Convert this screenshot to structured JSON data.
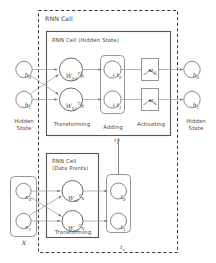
{
  "diagram": {
    "outer_box_label": "RNN Cell",
    "hidden_box_label": "RNN Cell (Hidden State)",
    "data_box_label_line1": "RNN Cell",
    "data_box_label_line2": "(Data Points)",
    "stage_labels": {
      "hidden_state_left_line1": "Hidden",
      "hidden_state_left_line2": "State",
      "hidden_state_right_line1": "Hidden",
      "hidden_state_right_line2": "State",
      "transforming_top": "Transforming",
      "adding_line1": "Adding",
      "adding_line2": "t",
      "adding_line2_sub": "x",
      "activating": "Activating",
      "transforming_bottom": "Transforming",
      "tx_group": "t",
      "tx_group_sub": "x",
      "x_group": "X"
    },
    "nodes": {
      "hidden_inputs": [
        {
          "base": "h",
          "sub": "0"
        },
        {
          "base": "h",
          "sub": "1"
        }
      ],
      "hidden_transform": [
        {
          "base": "W",
          "sub": "h0",
          "sup": "T",
          "arg": "h"
        },
        {
          "base": "W",
          "sub": "h1",
          "sup": "T",
          "arg": "h"
        }
      ],
      "adding": [
        {
          "base": "+t",
          "sub": "0"
        },
        {
          "base": "+t",
          "sub": "1"
        }
      ],
      "activating": [
        {
          "base": "z",
          "sub": "0"
        },
        {
          "base": "z",
          "sub": "1"
        }
      ],
      "hidden_outputs": [
        {
          "base": "h",
          "sub": "0"
        },
        {
          "base": "h",
          "sub": "1"
        }
      ],
      "data_inputs": [
        {
          "base": "x",
          "sub": "0"
        },
        {
          "base": "x",
          "sub": "1"
        }
      ],
      "data_transform": [
        {
          "base": "W",
          "sub": "x0",
          "sup": "T",
          "arg": "x"
        },
        {
          "base": "W",
          "sub": "x1",
          "sup": "T",
          "arg": "x"
        }
      ],
      "data_outputs": [
        {
          "base": "t",
          "sub": "0"
        },
        {
          "base": "t",
          "sub": "1"
        }
      ]
    },
    "colors": {
      "stroke": "#555555",
      "light_stroke": "#8a8a8a",
      "dashed": "#3a3a3a",
      "text": "#4a4a4a",
      "background": "#ffffff"
    }
  }
}
